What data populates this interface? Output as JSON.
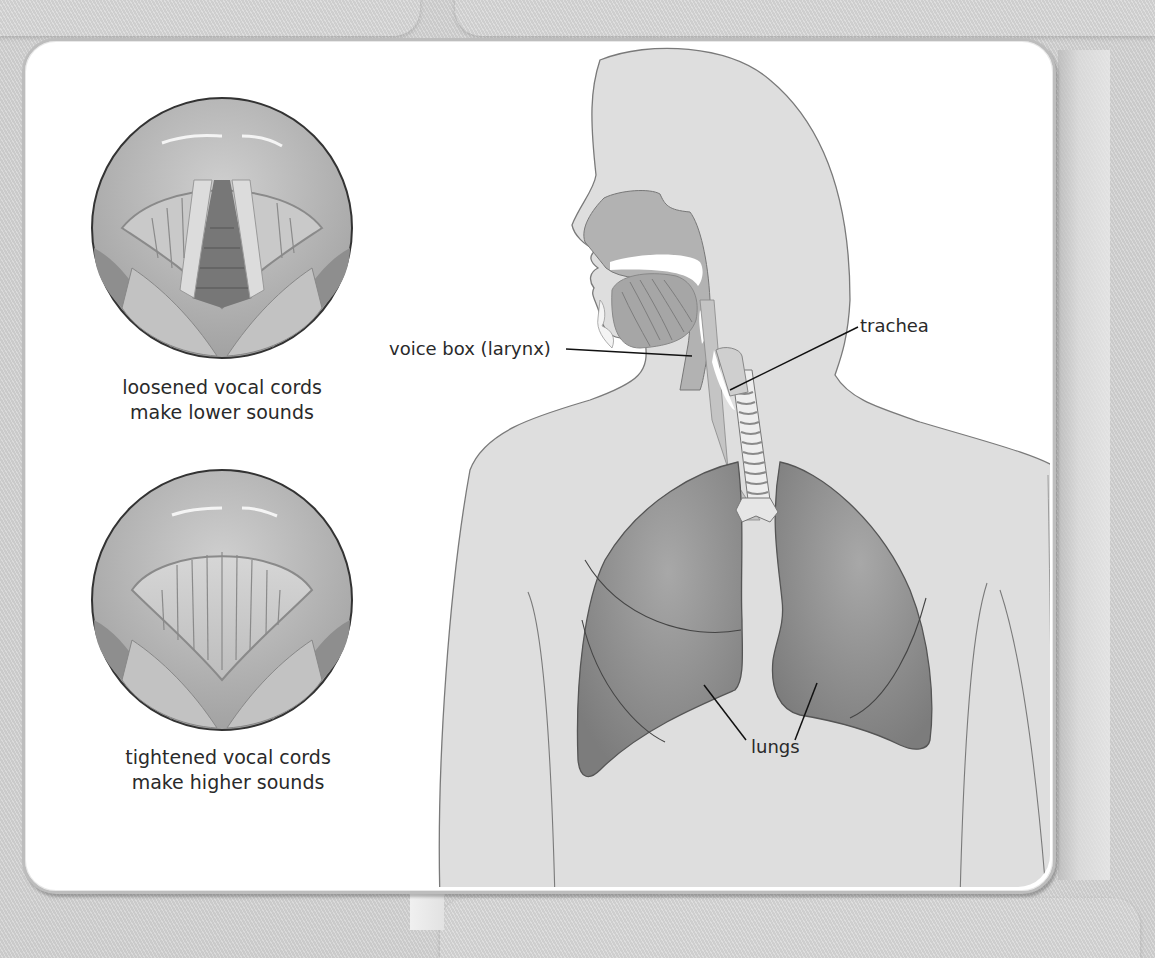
{
  "figure": {
    "palette": {
      "background": "#d2d2d2",
      "card": "#ffffff",
      "body_fill": "#dedede",
      "body_outline": "#7a7a7a",
      "airway": "#b4b4b4",
      "lungs": "#8c8c8c",
      "lung_outline": "#555555",
      "leader_line": "#111111",
      "text": "#2a2a2a"
    }
  },
  "larynx_views": [
    {
      "id": "loosened",
      "caption_line1": "loosened vocal cords",
      "caption_line2": "make lower sounds"
    },
    {
      "id": "tightened",
      "caption_line1": "tightened vocal cords",
      "caption_line2": "make higher sounds"
    }
  ],
  "labels": {
    "voice_box": "voice box (larynx)",
    "trachea": "trachea",
    "lungs": "lungs"
  }
}
